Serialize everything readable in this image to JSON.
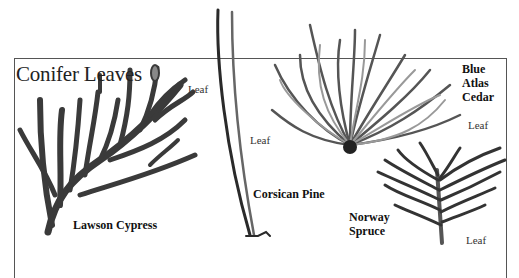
{
  "diagram": {
    "title": "Conifer Leaves",
    "species": [
      {
        "name": "Lawson Cypress",
        "leaf_label": "Leaf"
      },
      {
        "name": "Corsican Pine",
        "leaf_label": "Leaf"
      },
      {
        "name": "Blue Atlas Cedar",
        "name_lines": [
          "Blue",
          "Atlas",
          "Cedar"
        ],
        "leaf_label": "Leaf"
      },
      {
        "name": "Norway Spruce",
        "name_lines": [
          "Norway",
          "Spruce"
        ],
        "leaf_label": "Leaf"
      }
    ],
    "colors": {
      "ink": "#222222",
      "frame": "#555555",
      "background": "#ffffff"
    }
  }
}
